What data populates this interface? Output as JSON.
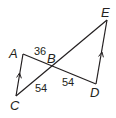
{
  "figure": {
    "type": "geometry-diagram",
    "stroke_color": "#231f20",
    "points": {
      "A": {
        "label": "A",
        "x": 23,
        "y": 54
      },
      "B": {
        "label": "B",
        "x": 52,
        "y": 66
      },
      "C": {
        "label": "C",
        "x": 16,
        "y": 96
      },
      "D": {
        "label": "D",
        "x": 96,
        "y": 84
      },
      "E": {
        "label": "E",
        "x": 107,
        "y": 20
      }
    },
    "segments": [
      {
        "from": "A",
        "to": "C",
        "parallel_mark": true
      },
      {
        "from": "A",
        "to": "D",
        "parallel_mark": false
      },
      {
        "from": "C",
        "to": "E",
        "parallel_mark": false
      },
      {
        "from": "D",
        "to": "E",
        "parallel_mark": true
      }
    ],
    "measures": {
      "AB": "36",
      "BC": "54",
      "BD": "54"
    }
  }
}
